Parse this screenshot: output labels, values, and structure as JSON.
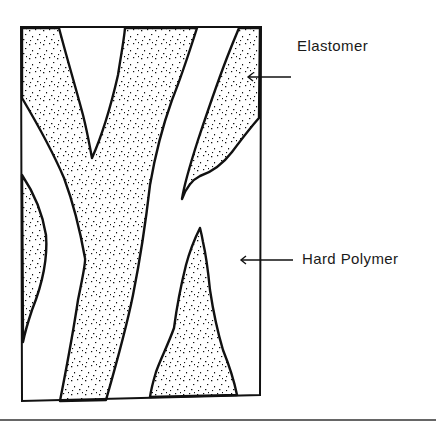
{
  "figure": {
    "labels": [
      {
        "id": "elastomer",
        "text": "Elastomer",
        "points_to": "stippled region"
      },
      {
        "id": "hard_polymer",
        "text": "Hard Polymer",
        "points_to": "clear region"
      }
    ]
  },
  "colors": {
    "ink": "#111111",
    "background": "#ffffff"
  }
}
